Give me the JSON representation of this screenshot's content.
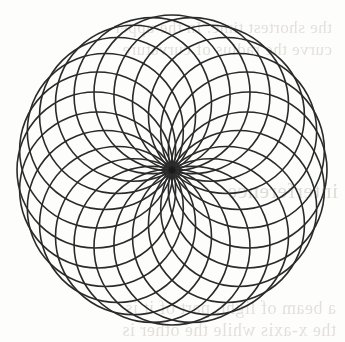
{
  "page": {
    "background_color": "#fdfdfc",
    "width": 345,
    "height": 342
  },
  "figure": {
    "center_marker_label": "*",
    "ink_color": "#2a2a2a",
    "fill_color": "none"
  },
  "ghost_text": {
    "note": "faint mirrored bleed-through from the reverse side of the scanned page; only partially legible",
    "lines": [
      "the shortest time. In the upper",
      "curve the radius of curvature",
      "interference",
      "a beam of light, part of it is",
      "the x-axis while the other is"
    ]
  },
  "chart_data": {
    "type": "line",
    "subtitle": "",
    "xlabel": "",
    "ylabel": "",
    "grid": false,
    "legend": null,
    "axis_visible": false,
    "xlim": [
      0,
      345
    ],
    "ylim": [
      0,
      342
    ],
    "geometry": {
      "center_x": 172,
      "center_y": 170,
      "n_circles": 24,
      "circle_radius": 78,
      "offset_radius": 77,
      "angle_step_deg": 15,
      "start_angle_deg": 0,
      "outer_extent_radius": 155,
      "inner_hole_radius": 67,
      "stroke_width": 1.6,
      "stroke_color": "#2a2a2a"
    },
    "center_marker": {
      "x": 172,
      "y": 170,
      "radius": 3.4,
      "glyph": "asterisk",
      "color": "#1a1a1a"
    },
    "annotations": [
      {
        "text": "outer scalloped envelope formed by 24 lobes",
        "x": 172,
        "y": 22
      },
      {
        "text": "bright inner envelope circle (caustic)",
        "x": 172,
        "y": 170
      }
    ]
  }
}
